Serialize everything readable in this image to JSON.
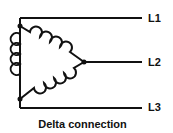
{
  "diagram": {
    "title": "Delta connection",
    "lines": [
      {
        "label": "L1"
      },
      {
        "label": "L2"
      },
      {
        "label": "L3"
      }
    ],
    "stroke_color": "#111111",
    "background": "#ffffff"
  }
}
